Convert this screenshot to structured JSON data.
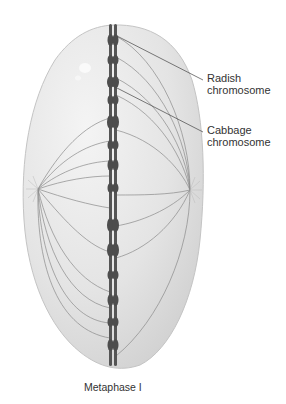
{
  "diagram": {
    "title": "Metaphase I",
    "labels": [
      {
        "id": "radish",
        "line1": "Radish",
        "line2": "chromosome"
      },
      {
        "id": "cabbage",
        "line1": "Cabbage",
        "line2": "chromosome"
      }
    ],
    "caption": "Metaphase I",
    "colors": {
      "cell_fill": "#e2e2e2",
      "cell_edge": "#c8c8c8",
      "chromosome": "#4a4a4a",
      "spindle": "#8a8a8a",
      "leader_line": "#444444",
      "text": "#333333"
    }
  }
}
